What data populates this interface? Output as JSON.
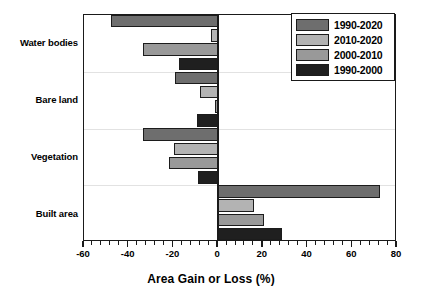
{
  "chart_data": {
    "type": "bar",
    "orientation": "horizontal",
    "title": "",
    "xlabel": "Area Gain or Loss (%)",
    "ylabel": "",
    "xlim": [
      -60,
      80
    ],
    "ylim": [
      0,
      4
    ],
    "grid": "horizontal-faint",
    "legend_position": "top-right",
    "categories": [
      "Water bodies",
      "Bare land",
      "Vegetation",
      "Built area"
    ],
    "xticks": [
      -60,
      -40,
      -20,
      0,
      20,
      40,
      60,
      80
    ],
    "xtick_labels": [
      "-60",
      "-40",
      "-20",
      "0",
      "20",
      "40",
      "60",
      "80"
    ],
    "series": [
      {
        "name": "1990-2020",
        "color": "#6e6e6e",
        "values": [
          -48.0,
          -19.5,
          -33.4,
          72.6
        ]
      },
      {
        "name": "2010-2020",
        "color": "#b3b3b3",
        "values": [
          -3.0,
          -8.0,
          -19.6,
          16.0
        ]
      },
      {
        "name": "2000-2010",
        "color": "#999999",
        "values": [
          -33.4,
          -1.5,
          -21.8,
          20.5
        ]
      },
      {
        "name": "1990-2000",
        "color": "#1f1f1f",
        "values": [
          -17.4,
          -9.5,
          -9.0,
          28.5
        ]
      }
    ]
  },
  "legend": {
    "items": [
      {
        "label": "1990-2020",
        "color": "#6e6e6e"
      },
      {
        "label": "2010-2020",
        "color": "#b3b3b3"
      },
      {
        "label": "2000-2010",
        "color": "#999999"
      },
      {
        "label": "1990-2000",
        "color": "#1f1f1f"
      }
    ]
  },
  "axis": {
    "x_title": "Area Gain or Loss (%)"
  }
}
